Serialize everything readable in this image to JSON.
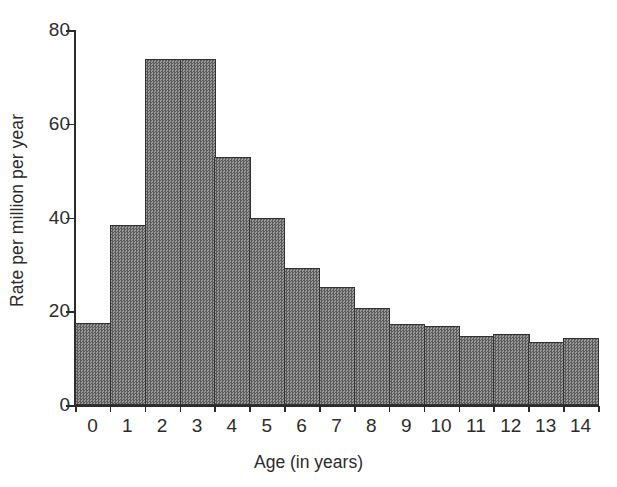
{
  "chart_data": {
    "type": "bar",
    "title": "",
    "subtitle": "",
    "xlabel": "Age (in years)",
    "ylabel": "Rate per million per year",
    "categories": [
      "0",
      "1",
      "2",
      "3",
      "4",
      "5",
      "6",
      "7",
      "8",
      "9",
      "10",
      "11",
      "12",
      "13",
      "14"
    ],
    "values": [
      17.5,
      38.3,
      73.8,
      73.8,
      53.0,
      40.0,
      29.3,
      25.2,
      20.8,
      17.2,
      16.8,
      14.8,
      15.1,
      13.5,
      14.2
    ],
    "ylim": [
      0,
      80
    ],
    "yticks": [
      0,
      20,
      40,
      60,
      80
    ],
    "ytick_labels": [
      "0",
      "20",
      "40",
      "60",
      "80"
    ],
    "xtick_labels": [
      "0",
      "1",
      "2",
      "3",
      "4",
      "5",
      "6",
      "7",
      "8",
      "9",
      "10",
      "11",
      "12",
      "13",
      "14"
    ],
    "grid": false,
    "legend": null,
    "legend_position": "none",
    "bar_style": {
      "fill": "#6f6f6f",
      "pattern": "checkerboard-dither",
      "edge_color": "#333030",
      "gap": 0
    },
    "axis_color": "#2b2b2b",
    "text_color": "#2e2b2c",
    "background": "#ffffff"
  }
}
